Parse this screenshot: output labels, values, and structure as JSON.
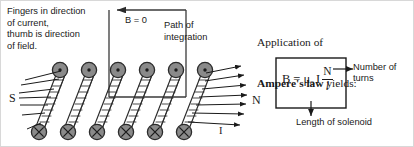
{
  "figure": {
    "border_color": "#d8d8d8",
    "background": "#ffffff"
  },
  "annotations": {
    "instruction": "Fingers in direction\nof current,\nthumb is direction\nof field.",
    "b_zero": "B = 0",
    "path_of_integration": "Path of\nintegration",
    "ampere_line1": "Application of",
    "ampere_bold": "Ampere's law",
    "ampere_line2_tail": " yields:",
    "number_of_turns": "Number of\nturns",
    "length_of_solenoid": "Length of solenoid",
    "pole_south": "S",
    "pole_north": "N",
    "current": "I"
  },
  "formula": {
    "b": "B",
    "equals": "=",
    "mu": "μ",
    "mu_subscript": "o",
    "current_symbol": "I",
    "numerator": "N",
    "denominator": "l",
    "full_text": "B = μ₀ I N / l"
  },
  "solenoid": {
    "turns_top_count": 6,
    "turns_bottom_count": 6,
    "top_marker": "dot",
    "bottom_marker": "cross",
    "coil_fill": "#8a8a8a",
    "coil_stroke": "#2b2b2b",
    "field_lines_left_count": 7,
    "field_lines_right_count": 7,
    "line_color": "#1a1a1a"
  },
  "integration_path": {
    "shape": "rectangle",
    "direction_arrow": "left",
    "stroke": "#3a3a3a"
  }
}
